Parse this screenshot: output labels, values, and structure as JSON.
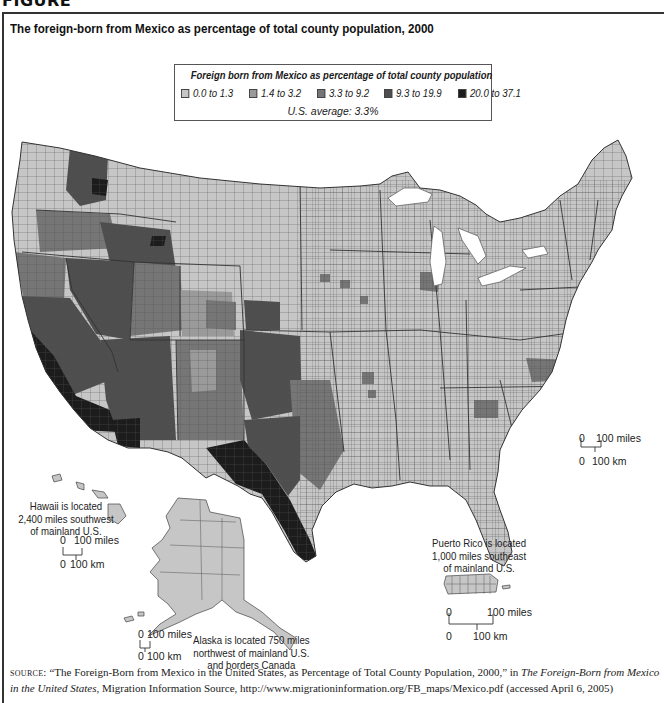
{
  "figure_label": "FIGURE",
  "title": "The foreign-born from Mexico as percentage of total county population, 2000",
  "legend": {
    "title": "Foreign born from Mexico as percentage of total county population",
    "items": [
      {
        "label": "0.0 to 1.3",
        "color": "#c6c6c6"
      },
      {
        "label": "1.4 to 3.2",
        "color": "#9a9a9a"
      },
      {
        "label": "3.3 to 9.2",
        "color": "#767676"
      },
      {
        "label": "9.3 to 19.9",
        "color": "#4e4e4e"
      },
      {
        "label": "20.0 to 37.1",
        "color": "#1c1c1c"
      }
    ],
    "average": "U.S. average: 3.3%"
  },
  "map": {
    "regions": [
      {
        "name": "Washington west",
        "class": 1
      },
      {
        "name": "Washington east (Yakima area)",
        "class": 3
      },
      {
        "name": "Oregon coast",
        "class": 1
      },
      {
        "name": "Oregon central",
        "class": 2
      },
      {
        "name": "Oregon east",
        "class": 2
      },
      {
        "name": "Idaho south",
        "class": 3
      },
      {
        "name": "Idaho north",
        "class": 0
      },
      {
        "name": "Montana",
        "class": 0
      },
      {
        "name": "Wyoming",
        "class": 0
      },
      {
        "name": "Northern California",
        "class": 2
      },
      {
        "name": "Central California",
        "class": 3
      },
      {
        "name": "Southern California",
        "class": 3
      },
      {
        "name": "California border",
        "class": 4
      },
      {
        "name": "Nevada",
        "class": 2
      },
      {
        "name": "Utah",
        "class": 2
      },
      {
        "name": "Arizona",
        "class": 3
      },
      {
        "name": "Colorado west",
        "class": 1
      },
      {
        "name": "Colorado east",
        "class": 2
      },
      {
        "name": "New Mexico",
        "class": 2
      },
      {
        "name": "West Texas",
        "class": 3
      },
      {
        "name": "Texas border",
        "class": 4
      },
      {
        "name": "Central Texas",
        "class": 2
      },
      {
        "name": "Kansas southwest",
        "class": 3
      },
      {
        "name": "Great Plains",
        "class": 0
      },
      {
        "name": "Midwest",
        "class": 0
      },
      {
        "name": "Chicago area",
        "class": 2
      },
      {
        "name": "South",
        "class": 0
      },
      {
        "name": "North Carolina piedmont",
        "class": 2
      },
      {
        "name": "Georgia north",
        "class": 2
      },
      {
        "name": "Florida south-central",
        "class": 2
      },
      {
        "name": "Northeast",
        "class": 0
      },
      {
        "name": "Alaska",
        "class": 0
      },
      {
        "name": "Hawaii",
        "class": 0
      },
      {
        "name": "Puerto Rico",
        "class": 0
      }
    ]
  },
  "insets": {
    "hawaii": {
      "note": [
        "Hawaii is located",
        "2,400 miles southwest",
        "of mainland U.S."
      ],
      "scale_miles": [
        "0",
        "100 miles"
      ],
      "scale_km": [
        "0",
        "100 km"
      ]
    },
    "alaska": {
      "note": [
        "Alaska is located 750 miles",
        "northwest of mainland U.S.",
        "and borders Canada"
      ],
      "scale_miles": [
        "0",
        "100 miles"
      ],
      "scale_km": [
        "0",
        "100 km"
      ]
    },
    "puerto_rico": {
      "note": [
        "Puerto Rico is located",
        "1,000 miles southeast",
        "of mainland U.S."
      ],
      "scale_miles": [
        "0",
        "100 miles"
      ],
      "scale_km": [
        "0",
        "100 km"
      ]
    },
    "mainland_scale": {
      "scale_miles": [
        "0",
        "100 miles"
      ],
      "scale_km": [
        "0",
        "100 km"
      ]
    }
  },
  "source": {
    "label": "Source:",
    "quote": "“The Foreign-Born from Mexico in the United States, as Percentage of Total County Population, 2000,” in ",
    "publication": "The Foreign-Born from Mexico in the United States",
    "rest": ", Migration Information Source, http://www.migrationinformation.org/FB_maps/Mexico.pdf (accessed April 6, 2005)"
  }
}
